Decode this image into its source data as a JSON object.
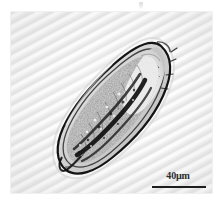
{
  "figure": {
    "caption_present": false,
    "background_color": "#ececec",
    "frame_color": "#e2e2e2",
    "plate_width_px": 201,
    "plate_height_px": 181
  },
  "specimen": {
    "name": "specimen-micrograph",
    "description": "elongated tapered parasitic organism",
    "orientation": "anterior upper-right, posterior lower-left",
    "outline_color": "#1a1a1a",
    "interior_color": "#6b6b6b"
  },
  "scale_bar": {
    "label": "40µm",
    "length_px": 54,
    "line_color": "#1d1d1d",
    "text_color": "#2b2b2b"
  },
  "artifact": {
    "label": "",
    "name": "top-edge-artifact"
  }
}
